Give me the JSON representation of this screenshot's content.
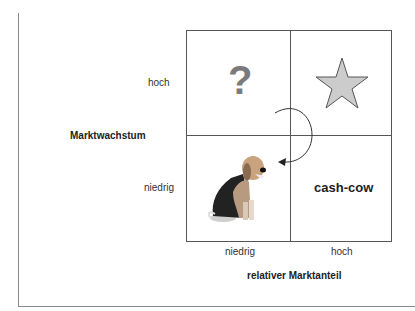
{
  "diagram": {
    "type": "bcg-matrix",
    "y_axis": {
      "title": "Marktwachstum",
      "high": "hoch",
      "low": "niedrig"
    },
    "x_axis": {
      "title": "relativer Marktanteil",
      "low": "niedrig",
      "high": "hoch"
    },
    "quadrants": {
      "top_left": {
        "symbol": "?",
        "meaning": "question-mark"
      },
      "top_right": {
        "symbol": "star",
        "meaning": "star"
      },
      "bottom_left": {
        "symbol": "dog",
        "meaning": "poor-dog"
      },
      "bottom_right": {
        "label": "cash-cow"
      }
    },
    "arrow": {
      "from": "top_left",
      "to": "bottom_left",
      "style": "curved"
    },
    "colors": {
      "lines": "#555555",
      "star_fill": "#cccccc",
      "question": "#7a7a7a"
    }
  }
}
